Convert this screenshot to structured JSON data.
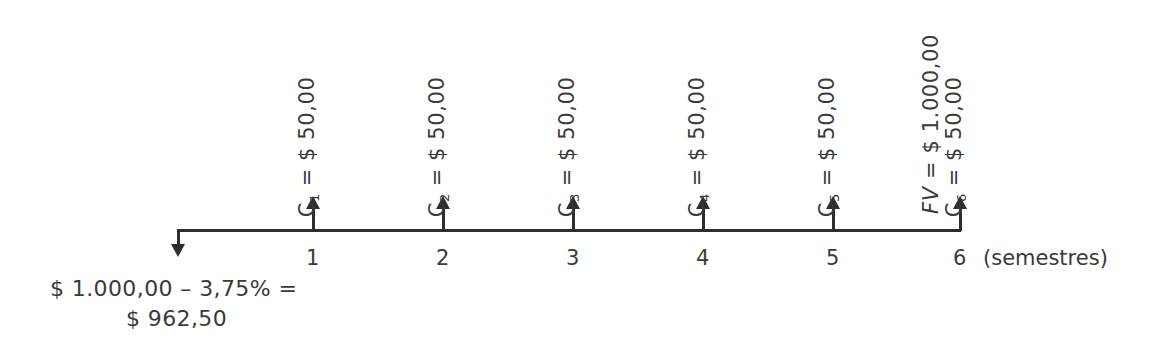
{
  "diagram": {
    "kind": "cash-flow-timeline",
    "axis": {
      "unit_label": "(semestres)",
      "line_color": "#2e2e2e",
      "start_arrow_direction": "down",
      "inflow_arrow_direction": "up",
      "period_count": 6
    },
    "periods": [
      {
        "number": "1",
        "labels": [
          {
            "symbol": "C",
            "subscript": "1",
            "equals": "=",
            "value": "$ 50,00",
            "italic": false
          }
        ]
      },
      {
        "number": "2",
        "labels": [
          {
            "symbol": "C",
            "subscript": "2",
            "equals": "=",
            "value": "$ 50,00",
            "italic": false
          }
        ]
      },
      {
        "number": "3",
        "labels": [
          {
            "symbol": "C",
            "subscript": "3",
            "equals": "=",
            "value": "$ 50,00",
            "italic": false
          }
        ]
      },
      {
        "number": "4",
        "labels": [
          {
            "symbol": "C",
            "subscript": "4",
            "equals": "=",
            "value": "$ 50,00",
            "italic": false
          }
        ]
      },
      {
        "number": "5",
        "labels": [
          {
            "symbol": "C",
            "subscript": "5",
            "equals": "=",
            "value": "$ 50,00",
            "italic": false
          }
        ]
      },
      {
        "number": "6",
        "labels": [
          {
            "symbol": "FV",
            "subscript": "",
            "equals": "=",
            "value": "$ 1.000,00",
            "italic": true
          },
          {
            "symbol": "C",
            "subscript": "6",
            "equals": "=",
            "value": "$ 50,00",
            "italic": false
          }
        ]
      }
    ],
    "initial_outflow": {
      "line1": "$ 1.000,00 – 3,75% =",
      "line2": "$ 962,50"
    }
  },
  "chart_data": {
    "type": "timeline",
    "title": "",
    "xlabel": "(semestres)",
    "ylabel": "",
    "categories": [
      "0",
      "1",
      "2",
      "3",
      "4",
      "5",
      "6"
    ],
    "series": [
      {
        "name": "Fluxo de caixa",
        "values": [
          -962.5,
          50,
          50,
          50,
          50,
          50,
          1050
        ]
      }
    ],
    "annotations": [
      "C_1 = $ 50,00",
      "C_2 = $ 50,00",
      "C_3 = $ 50,00",
      "C_4 = $ 50,00",
      "C_5 = $ 50,00",
      "C_6 = $ 50,00",
      "FV = $ 1.000,00",
      "$ 1.000,00 – 3,75% = $ 962,50"
    ],
    "grid": false,
    "legend_position": "none"
  }
}
